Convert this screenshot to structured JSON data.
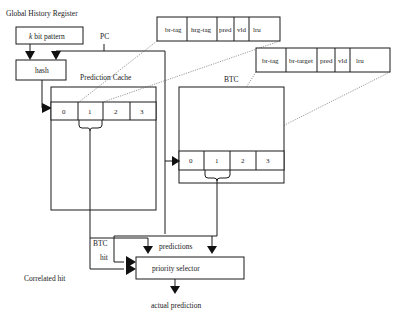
{
  "diagram": {
    "ghr_label": "Global History Register",
    "pattern_box": {
      "prefix": "k",
      "rest": " bit pattern"
    },
    "pc_label": "PC",
    "hash_label": "hash",
    "prediction_cache": {
      "title": "Prediction Cache",
      "cells": [
        "0",
        "1",
        "2",
        "3"
      ],
      "entry_fields": [
        "br-tag",
        "hrg-tag",
        "pred",
        "vld",
        "lru"
      ]
    },
    "btc": {
      "title": "BTC",
      "cells": [
        "0",
        "1",
        "2",
        "3"
      ],
      "entry_fields": [
        "br-tag",
        "br-target",
        "pred",
        "vld",
        "lru"
      ]
    },
    "selector": {
      "label": "priority selector",
      "predictions_label": "predictions",
      "btc_hit_label_1": "BTC",
      "btc_hit_label_2": "hit",
      "correlated_hit_label": "Correlated hit",
      "output_label": "actual prediction"
    }
  }
}
